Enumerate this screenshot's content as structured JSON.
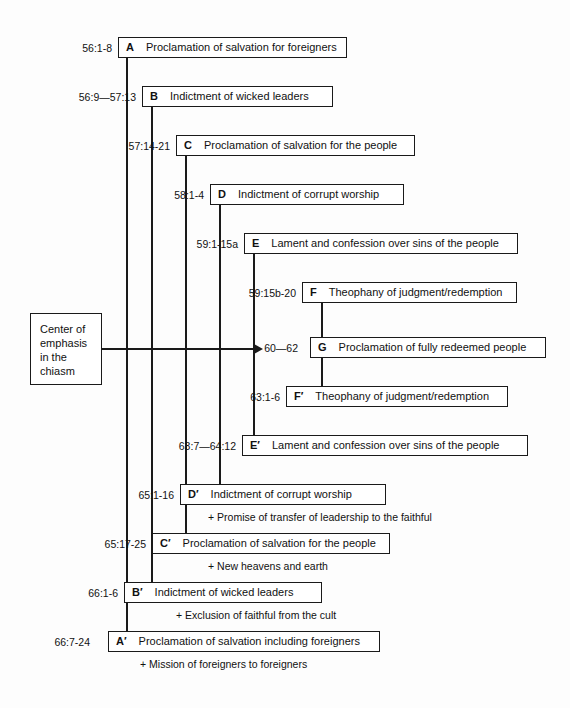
{
  "diagram": {
    "type": "chiasm",
    "center_box": {
      "lines": [
        "Center of",
        "emphasis",
        "in the",
        "chiasm"
      ]
    },
    "nodes": [
      {
        "ref": "56:1-8",
        "letter": "A",
        "text": "Proclamation of salvation for foreigners",
        "subnote": null
      },
      {
        "ref": "56:9—57:13",
        "letter": "B",
        "text": "Indictment of wicked leaders",
        "subnote": null
      },
      {
        "ref": "57:14-21",
        "letter": "C",
        "text": "Proclamation of salvation for the people",
        "subnote": null
      },
      {
        "ref": "58:1-4",
        "letter": "D",
        "text": "Indictment of corrupt worship",
        "subnote": null
      },
      {
        "ref": "59:1-15a",
        "letter": "E",
        "text": "Lament and confession over sins of the people",
        "subnote": null
      },
      {
        "ref": "59:15b-20",
        "letter": "F",
        "text": "Theophany of judgment/redemption",
        "subnote": null
      },
      {
        "ref": "60—62",
        "letter": "G",
        "text": "Proclamation of fully redeemed people",
        "subnote": null
      },
      {
        "ref": "63:1-6",
        "letter": "F′",
        "text": "Theophany of judgment/redemption",
        "subnote": null
      },
      {
        "ref": "63:7—64:12",
        "letter": "E′",
        "text": "Lament and confession over sins of the people",
        "subnote": null
      },
      {
        "ref": "65:1-16",
        "letter": "D′",
        "text": "Indictment of corrupt worship",
        "subnote": "+  Promise of transfer of leadership to the faithful"
      },
      {
        "ref": "65:17-25",
        "letter": "C′",
        "text": "Proclamation of salvation for the people",
        "subnote": "+  New heavens and earth"
      },
      {
        "ref": "66:1-6",
        "letter": "B′",
        "text": "Indictment of wicked leaders",
        "subnote": "+  Exclusion of faithful from the cult"
      },
      {
        "ref": "66:7-24",
        "letter": "A′",
        "text": "Proclamation of salvation including foreigners",
        "subnote": "+  Mission of foreigners to foreigners"
      }
    ]
  },
  "colors": {
    "ink": "#1a1a1a",
    "paper": "#fdfdfd"
  }
}
